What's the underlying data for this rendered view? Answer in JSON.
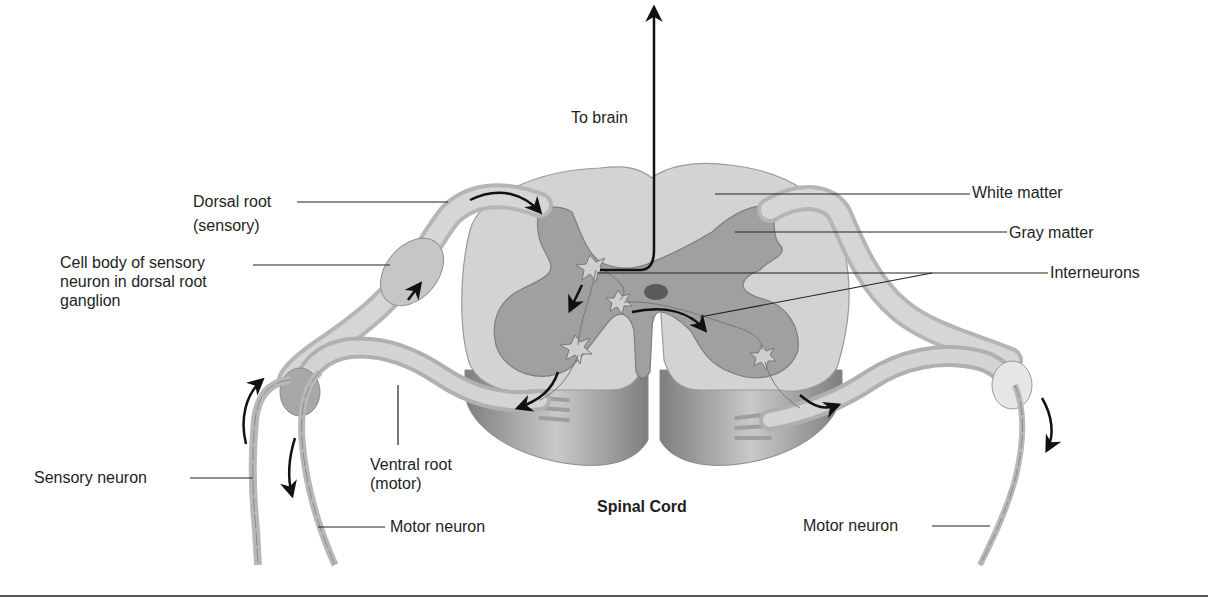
{
  "diagram": {
    "title": "Spinal Cord",
    "labels": {
      "to_brain": "To brain",
      "dorsal_root_line1": "Dorsal root",
      "dorsal_root_line2": "(sensory)",
      "cell_body_line1": "Cell body of sensory",
      "cell_body_line2": "neuron in dorsal root",
      "cell_body_line3": "ganglion",
      "white_matter": "White matter",
      "gray_matter": "Gray matter",
      "interneurons": "Interneurons",
      "sensory_neuron": "Sensory neuron",
      "ventral_root_line1": "Ventral root",
      "ventral_root_line2": "(motor)",
      "motor_neuron_left": "Motor neuron",
      "motor_neuron_right": "Motor neuron",
      "spinal_cord": "Spinal Cord"
    },
    "colors": {
      "white_matter": "#d2d2d2",
      "gray_matter": "#9c9c9c",
      "nerve": "#c8c8c8",
      "nerve_outline": "#8a8a8a",
      "arrow": "#111111",
      "leader_line": "#222222",
      "background": "#ffffff"
    },
    "structures": [
      "white-matter",
      "gray-matter",
      "central-canal",
      "dorsal-root",
      "dorsal-root-ganglion",
      "ventral-root",
      "sensory-neuron",
      "motor-neuron",
      "interneurons"
    ]
  }
}
